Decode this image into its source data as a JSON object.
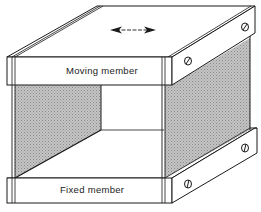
{
  "diagram": {
    "type": "isometric mechanical sketch",
    "labels": {
      "moving_member": "Moving member",
      "fixed_member": "Fixed member"
    },
    "motion_indicator": "double-headed horizontal arrow",
    "colors": {
      "line": "#1a1a1a",
      "panel_fill": "#b8b8b8",
      "background": "#ffffff"
    },
    "components": [
      {
        "name": "moving-member",
        "position": "top",
        "screws": 2
      },
      {
        "name": "fixed-member",
        "position": "bottom",
        "screws": 2
      },
      {
        "name": "flexure-panel-left",
        "shaded": true
      },
      {
        "name": "flexure-panel-right",
        "shaded": true
      }
    ]
  }
}
